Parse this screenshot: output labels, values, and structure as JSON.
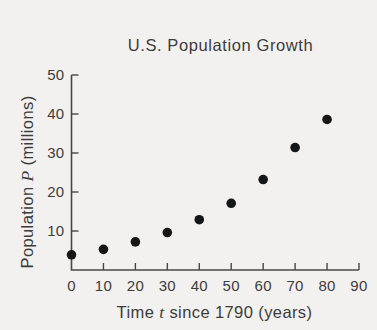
{
  "chart_data": {
    "type": "scatter",
    "title": "U.S. Population Growth",
    "xlabel": "Time t since 1790 (years)",
    "ylabel": "Population P (millions)",
    "xlabel_parts": {
      "pre": "Time ",
      "var": "t",
      "post": " since 1790 (years)"
    },
    "ylabel_parts": {
      "pre": "Population ",
      "var": "P",
      "post": " (millions)"
    },
    "x": [
      0,
      10,
      20,
      30,
      40,
      50,
      60,
      70,
      80
    ],
    "y": [
      3.9,
      5.3,
      7.2,
      9.6,
      12.9,
      17.1,
      23.2,
      31.4,
      38.6
    ],
    "x_ticks": [
      0,
      10,
      20,
      30,
      40,
      50,
      60,
      70,
      80,
      90
    ],
    "y_ticks": [
      10,
      20,
      30,
      40,
      50
    ],
    "xlim": [
      0,
      90
    ],
    "ylim": [
      0,
      50
    ],
    "grid": false,
    "legend": "none",
    "marker": "filled-circle",
    "colors": {
      "background": "#f3f1ef",
      "text": "#3c3c3c",
      "axis": "#474747",
      "point": "#161616"
    }
  }
}
